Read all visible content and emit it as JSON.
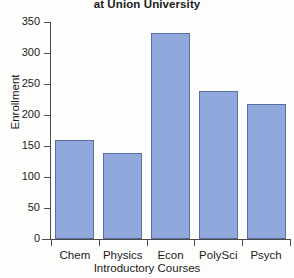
{
  "chart_data": {
    "type": "bar",
    "title": "at Union University",
    "xlabel": "Introductory Courses",
    "ylabel": "Enrollment",
    "categories": [
      "Chem",
      "Physics",
      "Econ",
      "PolySci",
      "Psych"
    ],
    "values": [
      160,
      139,
      332,
      238,
      218
    ],
    "ylim": [
      0,
      350
    ],
    "yticks": [
      0,
      50,
      100,
      150,
      200,
      250,
      300,
      350
    ],
    "ytick_labels": [
      "0",
      "50",
      "100",
      "150",
      "200",
      "250",
      "300",
      "350"
    ],
    "grid": false,
    "legend": false,
    "bar_color": "#90a8dc",
    "bar_edge_color": "#5a6e9e",
    "axis_color": "#4c4c4c",
    "background_color": "#fdfdfc",
    "text_color": "#1b1b1b"
  }
}
